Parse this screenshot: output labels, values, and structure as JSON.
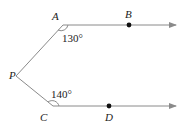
{
  "diagram": {
    "points": {
      "A": {
        "label": "A",
        "x": 63,
        "y": 25
      },
      "B": {
        "label": "B",
        "x": 129,
        "y": 25
      },
      "P": {
        "label": "P",
        "x": 16,
        "y": 76
      },
      "C": {
        "label": "C",
        "x": 53,
        "y": 106
      },
      "D": {
        "label": "D",
        "x": 109,
        "y": 106
      }
    },
    "angles": {
      "A": {
        "label": "130°"
      },
      "C": {
        "label": "140°"
      }
    },
    "colors": {
      "line": "#8a8a8a",
      "point": "#111111",
      "text": "#222222"
    }
  }
}
